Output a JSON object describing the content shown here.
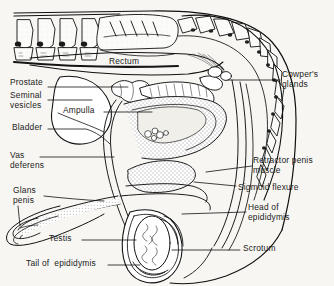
{
  "figure": {
    "type": "anatomical-line-diagram",
    "background_color": "#f7f6f3",
    "ink_color": "#111111",
    "width": 334,
    "height": 286
  },
  "labels": [
    {
      "id": "rectum",
      "text": "Rectum",
      "x": 128,
      "y": 62,
      "align": "ctr"
    },
    {
      "id": "prostate",
      "text": "Prostate",
      "x": 10,
      "y": 83,
      "align": "left"
    },
    {
      "id": "seminal-vesicles",
      "text": "Seminal\nvesicles",
      "x": 10,
      "y": 97,
      "align": "left"
    },
    {
      "id": "ampulla",
      "text": "Ampulla",
      "x": 66,
      "y": 108,
      "align": "left"
    },
    {
      "id": "bladder",
      "text": "Bladder",
      "x": 13,
      "y": 125,
      "align": "left"
    },
    {
      "id": "vas-deferens",
      "text": "Vas\ndeferens",
      "x": 11,
      "y": 153,
      "align": "left"
    },
    {
      "id": "glans-penis",
      "text": "Glans\npenis",
      "x": 14,
      "y": 188,
      "align": "left"
    },
    {
      "id": "testis",
      "text": "Testis",
      "x": 50,
      "y": 236,
      "align": "left"
    },
    {
      "id": "tail-of-epididymis",
      "text": "Tail of  epididymis",
      "x": 27,
      "y": 261,
      "align": "left"
    },
    {
      "id": "cowpers-glands",
      "text": "Cowper's\nglands",
      "x": 283,
      "y": 72,
      "align": "left"
    },
    {
      "id": "retractor-penis-muscle",
      "text": "Retractor penis\nmuscle",
      "x": 254,
      "y": 158,
      "align": "left"
    },
    {
      "id": "sigmoid-flexure",
      "text": "Sigmoid flexure",
      "x": 239,
      "y": 185,
      "align": "left"
    },
    {
      "id": "head-of-epididymis",
      "text": "Head of\nepididymis",
      "x": 249,
      "y": 205,
      "align": "left"
    },
    {
      "id": "scrotum",
      "text": "Scrotum",
      "x": 244,
      "y": 246,
      "align": "left"
    }
  ],
  "structures": [
    "lumbar vertebrae",
    "sacrum",
    "caudal vertebrae (tail)",
    "rectum",
    "prostate gland",
    "seminal vesicles",
    "ampulla of vas deferens",
    "urinary bladder",
    "vas deferens",
    "pelvic urethra",
    "Cowper's (bulbourethral) glands",
    "retractor penis muscle",
    "sigmoid flexure of penis",
    "body of penis",
    "glans penis",
    "prepuce / sheath",
    "testis",
    "head of epididymis",
    "tail of epididymis",
    "scrotum"
  ]
}
